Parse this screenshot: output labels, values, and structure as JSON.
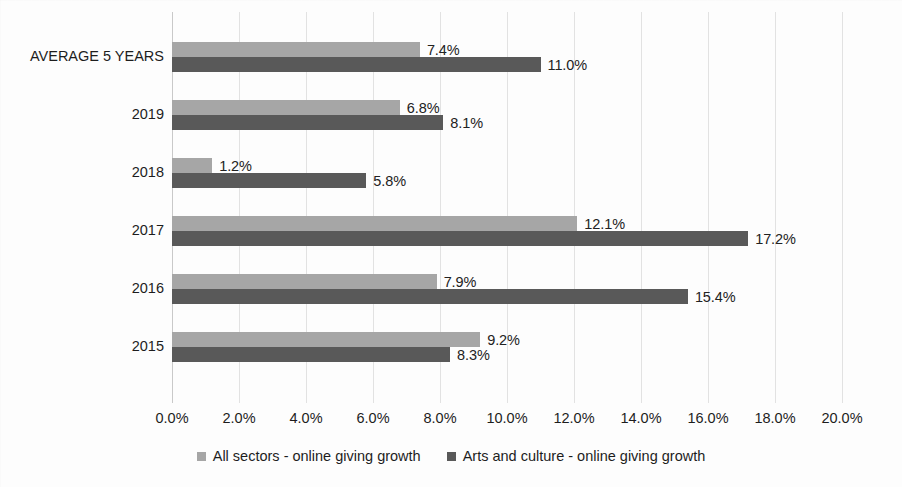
{
  "chart_data": {
    "type": "bar",
    "orientation": "horizontal",
    "title": "",
    "xlabel": "",
    "ylabel": "",
    "xlim": [
      0,
      20
    ],
    "xtick_step": 2,
    "xticks": [
      "0.0%",
      "2.0%",
      "4.0%",
      "6.0%",
      "8.0%",
      "10.0%",
      "12.0%",
      "14.0%",
      "16.0%",
      "18.0%",
      "20.0%"
    ],
    "grid": true,
    "legend_position": "bottom",
    "categories": [
      "AVERAGE 5 YEARS",
      "2019",
      "2018",
      "2017",
      "2016",
      "2015"
    ],
    "series": [
      {
        "name": "All sectors - online giving growth",
        "color": "#a6a6a6",
        "values": [
          7.4,
          6.8,
          1.2,
          12.1,
          7.9,
          9.2
        ],
        "labels": [
          "7.4%",
          "6.8%",
          "1.2%",
          "12.1%",
          "7.9%",
          "9.2%"
        ]
      },
      {
        "name": "Arts and culture - online giving growth",
        "color": "#595959",
        "values": [
          11.0,
          8.1,
          5.8,
          17.2,
          15.4,
          8.3
        ],
        "labels": [
          "11.0%",
          "8.1%",
          "5.8%",
          "17.2%",
          "15.4%",
          "8.3%"
        ]
      }
    ]
  },
  "legend": {
    "items": [
      {
        "label": "All sectors - online giving growth",
        "color": "#a6a6a6"
      },
      {
        "label": "Arts and culture - online giving growth",
        "color": "#595959"
      }
    ]
  }
}
